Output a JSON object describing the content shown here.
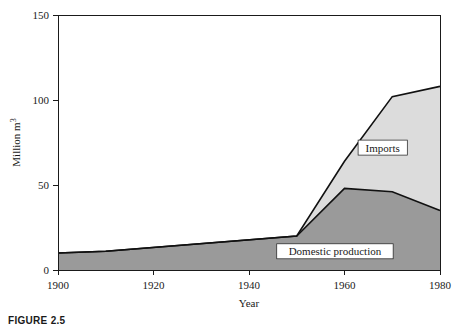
{
  "figure": {
    "caption": "FIGURE 2.5"
  },
  "chart_data": {
    "type": "area",
    "stacked": true,
    "title": "",
    "xlabel": "Year",
    "ylabel": "Million m",
    "ylabel_exponent": "3",
    "x": [
      1900,
      1910,
      1950,
      1960,
      1970,
      1980
    ],
    "xlim": [
      1900,
      1980
    ],
    "ylim": [
      0,
      150
    ],
    "xticks": [
      1900,
      1920,
      1940,
      1960,
      1980
    ],
    "xticklabels": [
      "1900",
      "1920",
      "1940",
      "1960",
      "1980"
    ],
    "yticks": [
      0,
      50,
      100,
      150
    ],
    "yticklabels": [
      "0",
      "50",
      "100",
      "150"
    ],
    "grid": false,
    "legend_position": "inline-annotation",
    "series": [
      {
        "name": "Domestic production",
        "label": "Domestic production",
        "color": "#9a9a9a",
        "values": [
          10,
          11,
          20,
          48,
          46,
          35
        ]
      },
      {
        "name": "Imports",
        "label": "Imports",
        "color": "#dcdcdc",
        "values": [
          0,
          0,
          0,
          16,
          56,
          73
        ]
      }
    ],
    "totals": [
      10,
      11,
      20,
      64,
      102,
      108
    ],
    "annotations": [
      {
        "text": "Imports",
        "x": 1968,
        "y": 72
      },
      {
        "text": "Domestic production",
        "x": 1958,
        "y": 11
      }
    ]
  },
  "colors": {
    "domestic_fill": "#9a9a9a",
    "imports_fill": "#dcdcdc",
    "axis": "#1a1a1a",
    "boundary": "#111111",
    "background": "#ffffff"
  }
}
